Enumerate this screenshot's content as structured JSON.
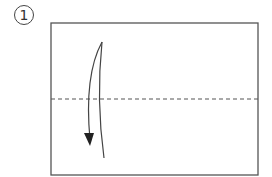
{
  "step": {
    "number": "1"
  },
  "diagram": {
    "paper": {
      "x": 51,
      "y": 23,
      "width": 207,
      "height": 152
    },
    "fold_line": {
      "type": "valley",
      "y": 99
    },
    "arrow": {
      "direction": "down"
    },
    "colors": {
      "line": "#555555",
      "background": "#ffffff"
    }
  }
}
